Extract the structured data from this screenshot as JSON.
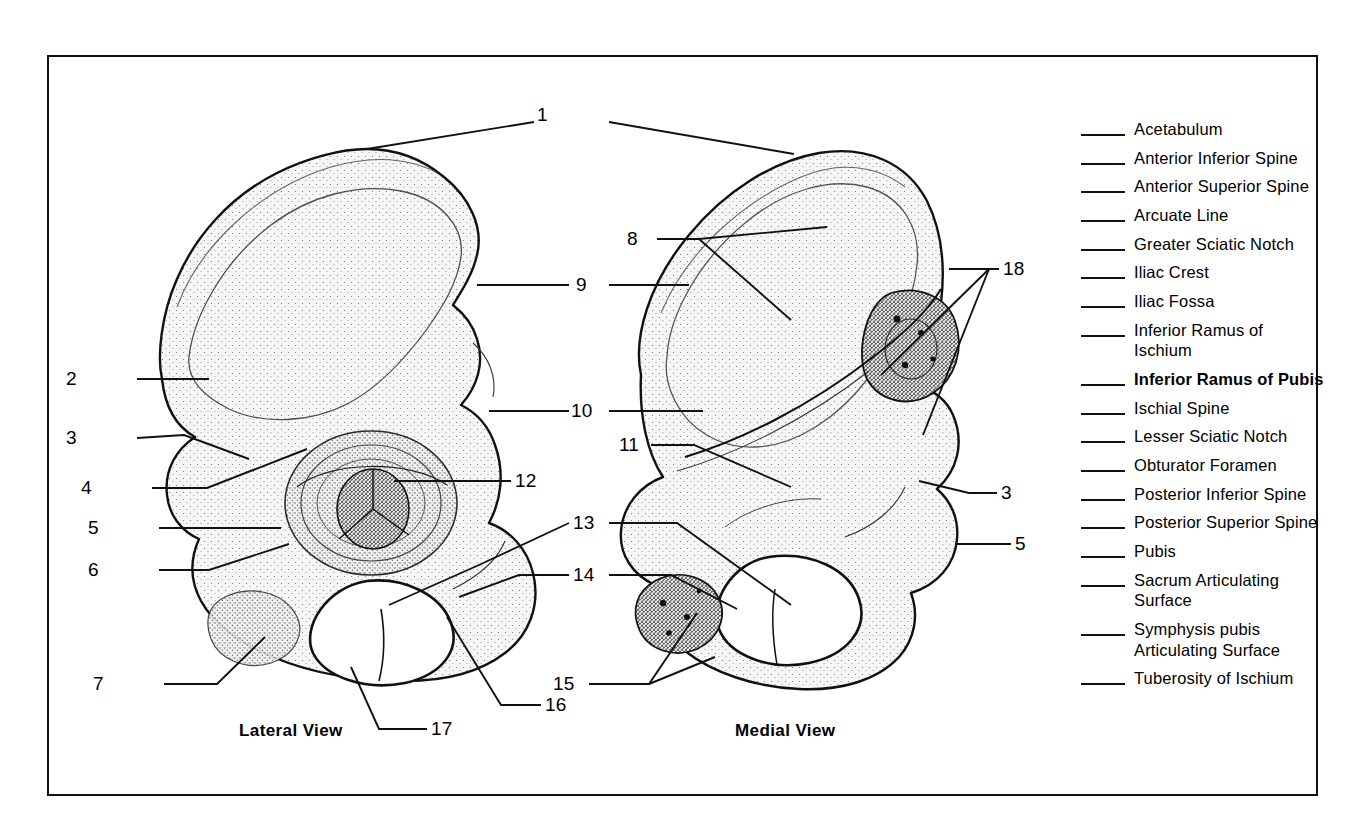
{
  "figure": {
    "views": [
      {
        "id": "lateral",
        "caption": "Lateral View"
      },
      {
        "id": "medial",
        "caption": "Medial View"
      }
    ],
    "callouts": [
      {
        "id": "c1",
        "number": "1"
      },
      {
        "id": "c2",
        "number": "2"
      },
      {
        "id": "c3",
        "number": "3"
      },
      {
        "id": "c4",
        "number": "4"
      },
      {
        "id": "c5",
        "number": "5"
      },
      {
        "id": "c6",
        "number": "6"
      },
      {
        "id": "c7",
        "number": "7"
      },
      {
        "id": "c8",
        "number": "8"
      },
      {
        "id": "c9",
        "number": "9"
      },
      {
        "id": "c10",
        "number": "10"
      },
      {
        "id": "c11",
        "number": "11"
      },
      {
        "id": "c12",
        "number": "12"
      },
      {
        "id": "c13",
        "number": "13"
      },
      {
        "id": "c14",
        "number": "14"
      },
      {
        "id": "c15",
        "number": "15"
      },
      {
        "id": "c16",
        "number": "16"
      },
      {
        "id": "c17",
        "number": "17"
      },
      {
        "id": "c18",
        "number": "18"
      },
      {
        "id": "c3r",
        "number": "3"
      },
      {
        "id": "c5r",
        "number": "5"
      }
    ]
  },
  "legend": {
    "items": [
      {
        "label": "Acetabulum",
        "bold": false
      },
      {
        "label": "Anterior Inferior Spine",
        "bold": false
      },
      {
        "label": "Anterior Superior Spine",
        "bold": false
      },
      {
        "label": "Arcuate Line",
        "bold": false
      },
      {
        "label": "Greater Sciatic Notch",
        "bold": false
      },
      {
        "label": "Iliac Crest",
        "bold": false
      },
      {
        "label": "Iliac Fossa",
        "bold": false
      },
      {
        "label": "Inferior Ramus of\n  Ischium",
        "bold": false
      },
      {
        "label": "Inferior Ramus of Pubis",
        "bold": true
      },
      {
        "label": "Ischial Spine",
        "bold": false
      },
      {
        "label": "Lesser Sciatic Notch",
        "bold": false
      },
      {
        "label": "Obturator Foramen",
        "bold": false
      },
      {
        "label": "Posterior Inferior Spine",
        "bold": false
      },
      {
        "label": "Posterior Superior Spine",
        "bold": false
      },
      {
        "label": "Pubis",
        "bold": false
      },
      {
        "label": "Sacrum Articulating\n  Surface",
        "bold": false
      },
      {
        "label": "Symphysis pubis\n  Articulating Surface",
        "bold": false
      },
      {
        "label": "Tuberosity of Ischium",
        "bold": false
      }
    ]
  },
  "colors": {
    "ink": "#111111",
    "paper": "#ffffff",
    "bone_fill": "#f4f4f2",
    "stipple": "#4a4a4a"
  }
}
